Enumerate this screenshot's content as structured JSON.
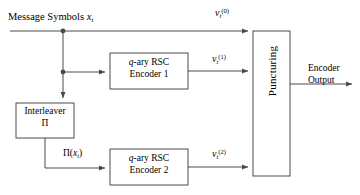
{
  "diagram": {
    "colors": {
      "line": "#4a4a4a",
      "box_border": "#4a4a4a",
      "text": "#000000",
      "background": "#ffffff"
    },
    "input_label": {
      "text_prefix": "Message Symbols ",
      "symbol": "x",
      "subscript": "t"
    },
    "blocks": [
      {
        "name": "interleaver",
        "line1": "Interleaver",
        "line2": "Π"
      },
      {
        "name": "encoder-1",
        "line1": "q-ary RSC",
        "line2": "Encoder 1",
        "italic_prefix": "q"
      },
      {
        "name": "encoder-2",
        "line1": "q-ary RSC",
        "line2": "Encoder 2",
        "italic_prefix": "q"
      },
      {
        "name": "puncturing",
        "label": "Puncturing",
        "orientation": "vertical"
      }
    ],
    "signals": [
      {
        "name": "v0",
        "symbol": "v",
        "subscript": "t",
        "superscript": "(0)"
      },
      {
        "name": "v1",
        "symbol": "v",
        "subscript": "t",
        "superscript": "(1)"
      },
      {
        "name": "v2",
        "symbol": "v",
        "subscript": "t",
        "superscript": "(2)"
      }
    ],
    "interleaved_label": {
      "pi": "Π(",
      "symbol": "x",
      "subscript": "t",
      "close": ")"
    },
    "output_label": {
      "line1": "Encoder",
      "line2": "Output"
    }
  }
}
